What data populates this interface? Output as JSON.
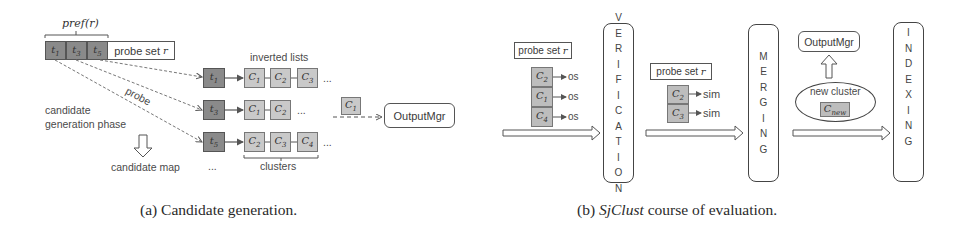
{
  "panel_a": {
    "pref_label": "pref(r)",
    "prefix_tokens": [
      "t",
      "t",
      "t"
    ],
    "prefix_subs": [
      "1",
      "3",
      "5"
    ],
    "probe_set_label": "probe set",
    "probe_set_var": "r",
    "inverted_lists_label": "inverted lists",
    "probe_label": "probe",
    "phase_label_1": "candidate",
    "phase_label_2": "generation phase",
    "candidate_map_label": "candidate map",
    "rows": [
      {
        "token": "t",
        "sub": "1",
        "clusters": [
          {
            "c": "C",
            "s": "1"
          },
          {
            "c": "C",
            "s": "2"
          },
          {
            "c": "C",
            "s": "3"
          }
        ]
      },
      {
        "token": "t",
        "sub": "3",
        "clusters": [
          {
            "c": "C",
            "s": "1"
          },
          {
            "c": "C",
            "s": "2"
          }
        ]
      },
      {
        "token": "t",
        "sub": "5",
        "clusters": [
          {
            "c": "C",
            "s": "2"
          },
          {
            "c": "C",
            "s": "3"
          },
          {
            "c": "C",
            "s": "4"
          }
        ]
      }
    ],
    "ellipsis": "...",
    "clusters_label": "clusters",
    "emitted_cluster": {
      "c": "C",
      "s": "1"
    },
    "output_mgr_label": "OutputMgr",
    "caption": "(a)  Candidate generation."
  },
  "panel_b": {
    "verification": {
      "probe_set_label": "probe set",
      "probe_set_var": "r",
      "items": [
        {
          "c": "C",
          "s": "2",
          "out": "os"
        },
        {
          "c": "C",
          "s": "1",
          "out": "os"
        },
        {
          "c": "C",
          "s": "4",
          "out": "os"
        }
      ],
      "stage_letters": [
        "V",
        "E",
        "R",
        "I",
        "F",
        "I",
        "C",
        "A",
        "T",
        "I",
        "O",
        "N"
      ]
    },
    "merging": {
      "probe_set_label": "probe set",
      "probe_set_var": "r",
      "items": [
        {
          "c": "C",
          "s": "2",
          "out": "sim"
        },
        {
          "c": "C",
          "s": "3",
          "out": "sim"
        }
      ],
      "stage_letters": [
        "M",
        "E",
        "R",
        "G",
        "I",
        "N",
        "G"
      ]
    },
    "indexing": {
      "output_mgr_label": "OutputMgr",
      "new_cluster_label": "new cluster",
      "new_cluster_c": "C",
      "new_cluster_sub": "new",
      "stage_letters": [
        "I",
        "N",
        "D",
        "E",
        "X",
        "I",
        "N",
        "G"
      ]
    },
    "caption_prefix": "(b) ",
    "caption_italic": "SjClust",
    "caption_suffix": " course of evaluation."
  }
}
